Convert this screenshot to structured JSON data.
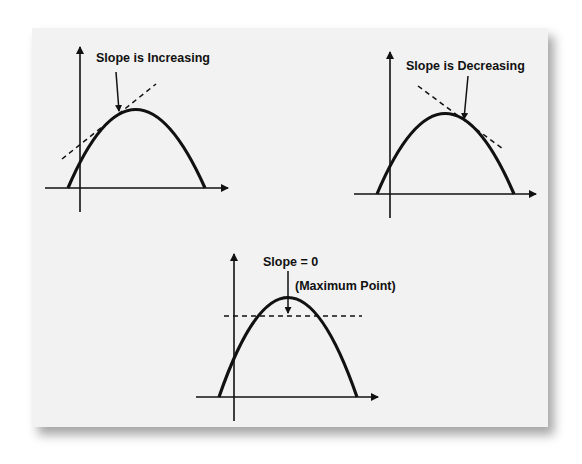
{
  "diagram": {
    "panels": [
      {
        "id": "increasing",
        "label": "Slope is Increasing",
        "tangent": "rising tangent on left side of curve"
      },
      {
        "id": "decreasing",
        "label": "Slope is Decreasing",
        "tangent": "falling tangent on right side of curve"
      },
      {
        "id": "maximum",
        "label": "Slope = 0",
        "sublabel": "(Maximum Point)",
        "tangent": "horizontal tangent at vertex"
      }
    ],
    "colors": {
      "card": "#f2f2f2",
      "ink": "#111111"
    }
  }
}
